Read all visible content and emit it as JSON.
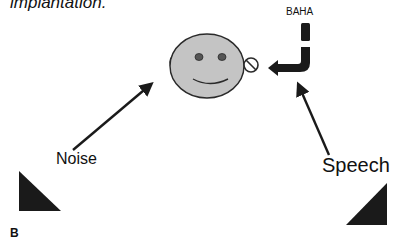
{
  "figure": {
    "caption": "implantation.",
    "panel_label": "B",
    "labels": {
      "device": "BAHA",
      "noise": "Noise",
      "speech": "Speech"
    },
    "colors": {
      "face_fill": "#c4c4c4",
      "outline": "#2a2a2a",
      "dark": "#1a1a1a",
      "background": "#ffffff"
    },
    "elements": [
      {
        "name": "head",
        "shape": "smiley-face"
      },
      {
        "name": "ear-left",
        "shape": "ear"
      },
      {
        "name": "baha-implant",
        "shape": "circle-with-slash"
      },
      {
        "name": "baha-device",
        "shape": "bent-bar"
      },
      {
        "name": "noise-source",
        "shape": "triangle",
        "position": "bottom-left"
      },
      {
        "name": "speech-source",
        "shape": "triangle",
        "position": "bottom-right"
      },
      {
        "name": "noise-arrow",
        "from": "noise-label",
        "to": "head-left"
      },
      {
        "name": "speech-arrow",
        "from": "speech-label",
        "to": "baha-device"
      },
      {
        "name": "baha-arrow",
        "from": "baha-device",
        "to": "baha-implant"
      }
    ]
  }
}
